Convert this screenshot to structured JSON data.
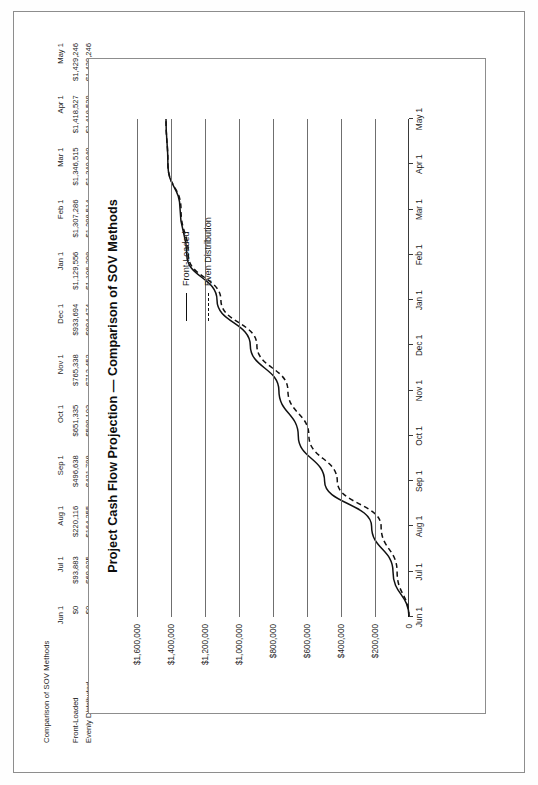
{
  "document": {
    "title": "Project Cash Flow Projection — Comparison of SOV Methods"
  },
  "table": {
    "caption": "Comparison of SOV Methods",
    "corner": "",
    "columns": [
      "Jun 1",
      "Jul 1",
      "Aug 1",
      "Sep 1",
      "Oct 1",
      "Nov 1",
      "Dec 1",
      "Jan 1",
      "Feb 1",
      "Mar 1",
      "Apr 1",
      "May 1"
    ],
    "rows": [
      {
        "label": "Front-Loaded",
        "values": [
          "$0",
          "$93,883",
          "$220,116",
          "$496,638",
          "$651,335",
          "$765,338",
          "$933,694",
          "$1,129,556",
          "$1,307,286",
          "$1,346,515",
          "$1,418,527",
          "$1,429,246"
        ]
      },
      {
        "label": "Evenly Distributed",
        "values": [
          "$0",
          "$69,825",
          "$164,255",
          "$421,798",
          "$589,103",
          "$712,452",
          "$894,474",
          "$1,106,298",
          "$1,298,514",
          "$1,340,940",
          "$1,418,529",
          "$1,429,246"
        ]
      }
    ]
  },
  "legend": {
    "items": [
      {
        "label": "Front-Loaded",
        "style": "solid"
      },
      {
        "label": "Even Distribution",
        "style": "dashed"
      }
    ]
  },
  "chart_data": {
    "type": "line",
    "title": "Project Cash Flow Projection — Comparison of SOV Methods",
    "xlabel": "",
    "ylabel": "",
    "x": [
      "Jun 1",
      "Jul 1",
      "Aug 1",
      "Sep 1",
      "Oct 1",
      "Nov 1",
      "Dec 1",
      "Jan 1",
      "Feb 1",
      "Mar 1",
      "Apr 1",
      "May 1"
    ],
    "ylim": [
      0,
      1600000
    ],
    "yticks": [
      0,
      200000,
      400000,
      600000,
      800000,
      1000000,
      1200000,
      1400000,
      1600000
    ],
    "ytick_labels": [
      "0",
      "$200,000",
      "$400,000",
      "$600,000",
      "$800,000",
      "$1,000,000",
      "$1,200,000",
      "$1,400,000",
      "$1,600,000"
    ],
    "grid": "y-gridlines-only",
    "legend_position": "upper-right-inside",
    "series": [
      {
        "name": "Front-Loaded",
        "style": "solid",
        "color": "#111111",
        "values": [
          0,
          93883,
          220116,
          496638,
          651335,
          765338,
          933694,
          1129556,
          1307286,
          1346515,
          1418527,
          1429246
        ]
      },
      {
        "name": "Even Distribution",
        "style": "dashed",
        "color": "#111111",
        "values": [
          0,
          69825,
          164255,
          421798,
          589103,
          712452,
          894474,
          1106298,
          1298514,
          1340940,
          1418529,
          1429246
        ]
      }
    ]
  }
}
